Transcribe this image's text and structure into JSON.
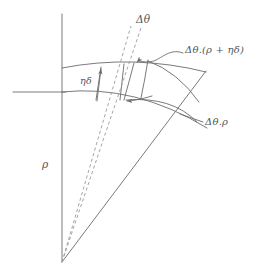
{
  "figure": {
    "title": "",
    "kind": "annular-sector-geometry-diagram",
    "width": 261,
    "height": 280,
    "background": "#ffffff"
  },
  "colors": {
    "stroke": "#6b6b70",
    "dashed_stroke": "#9a9aa0",
    "text": "#55555a",
    "background": "#ffffff"
  },
  "labels": {
    "delta_theta": "Δθ",
    "outer_arc_length": "Δθ.(ρ + ηδ)",
    "inner_arc_length": "Δθ.ρ",
    "thickness": "ηδ",
    "radius": "ρ"
  },
  "geometry": {
    "apex": [
      62,
      262
    ],
    "vertical_axis": {
      "x": 62,
      "y_top": 14,
      "y_bottom": 262
    },
    "horizontal_ray": {
      "y": 92,
      "x_left": 13,
      "x_right": 66
    },
    "diagonal_ray": {
      "from": [
        62,
        262
      ],
      "to": [
        206,
        71
      ]
    },
    "dashed_rays": [
      {
        "from": [
          62,
          262
        ],
        "to": [
          131,
          26
        ]
      },
      {
        "from": [
          62,
          262
        ],
        "to": [
          141,
          28
        ]
      }
    ],
    "inner_arc": {
      "start": [
        62,
        92
      ],
      "control": [
        135,
        86
      ],
      "end": [
        207,
        128
      ]
    },
    "outer_arc": {
      "start": [
        62,
        68
      ],
      "control": [
        134,
        55
      ],
      "end": [
        206,
        72
      ]
    },
    "radial_segment_inner": {
      "from": [
        124,
        100
      ],
      "to": [
        134,
        63
      ]
    },
    "radial_segment_outer": {
      "from": [
        141,
        98
      ],
      "to": [
        148,
        60
      ]
    },
    "thickness_arrow": {
      "from": [
        96,
        100
      ],
      "to": [
        101,
        67
      ]
    },
    "thickness_quad": [
      [
        96,
        100
      ],
      [
        101,
        67
      ],
      [
        124,
        63
      ],
      [
        120,
        100
      ]
    ],
    "cross_curve": {
      "from": [
        124,
        100
      ],
      "control": [
        170,
        95
      ],
      "end": [
        196,
        121
      ]
    }
  },
  "annotations": {
    "outer_leader": "wavy S-curve from label to outer arc intersection arrowhead",
    "inner_leader": "straight leader from label to cross curve",
    "arrowheads": [
      "outer-arc-intersection",
      "inner-arc-intersection",
      "thickness-up"
    ]
  }
}
